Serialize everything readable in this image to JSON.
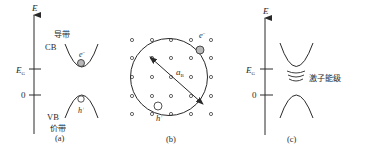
{
  "panels": {
    "a": {
      "caption": "(a)",
      "axis_label": "E",
      "gap_label": "E",
      "gap_sub": "G",
      "zero_label": "0",
      "cb_label_cn": "导带",
      "cb_label": "CB",
      "vb_label": "VB",
      "vb_label_cn": "价带",
      "electron_label": "e",
      "electron_sup": "−",
      "hole_label": "h",
      "hole_sup": "+"
    },
    "b": {
      "caption": "(b)",
      "radius_label": "a",
      "radius_sub": "B",
      "electron_label": "e",
      "electron_sup": "−",
      "hole_label": "h",
      "hole_sup": "+",
      "lattice_cols": 5,
      "lattice_rows": 5
    },
    "c": {
      "caption": "(c)",
      "axis_label": "E",
      "gap_label": "E",
      "gap_sub": "G",
      "zero_label": "0",
      "exciton_levels_label": "激子能级"
    }
  },
  "colors": {
    "line": "#2a2a2a",
    "electron_fill": "#b8b8b8",
    "hole_fill": "#ffffff",
    "lattice_dot": "#555555"
  }
}
